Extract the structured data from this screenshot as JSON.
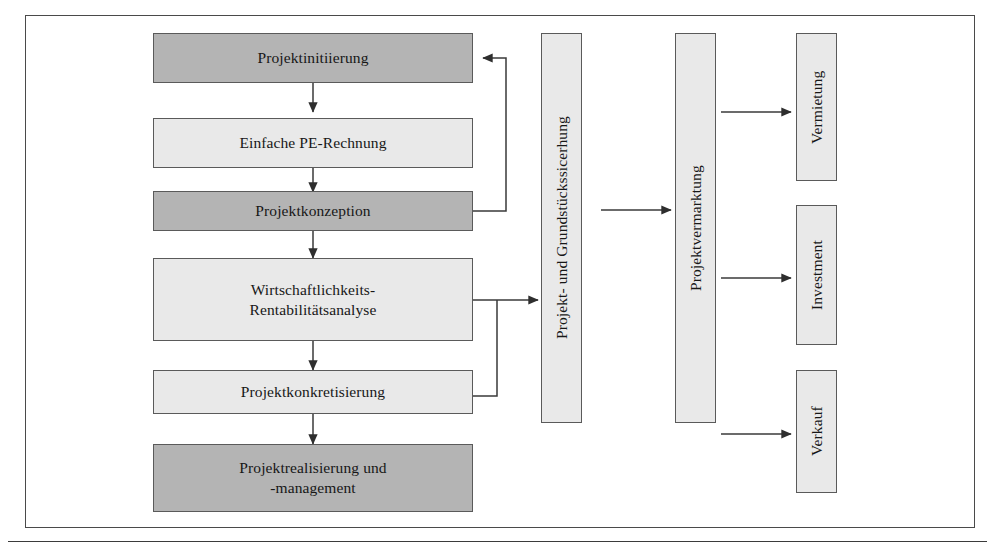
{
  "diagram": {
    "frame": {
      "visible": true,
      "border_color": "#4a4a4a"
    },
    "colors": {
      "dark_fill": "#b4b4b4",
      "light_fill": "#e9e9e9",
      "box_border": "#5a5a5a",
      "connector": "#3a3a3a",
      "background": "#ffffff"
    },
    "nodes": [
      {
        "id": "projektinitiierung",
        "label": "Projektinitiierung",
        "shade": "dark",
        "orientation": "horizontal"
      },
      {
        "id": "einfache-pe-rechnung",
        "label": "Einfache PE-Rechnung",
        "shade": "light",
        "orientation": "horizontal"
      },
      {
        "id": "projektkonzeption",
        "label": "Projektkonzeption",
        "shade": "dark",
        "orientation": "horizontal"
      },
      {
        "id": "wirtschaftlichkeit",
        "label": "Wirtschaftlichkeits-\nRentabilitätsanalyse",
        "shade": "light",
        "orientation": "horizontal"
      },
      {
        "id": "projektkonkretisierung",
        "label": "Projektkonkretisierung",
        "shade": "light",
        "orientation": "horizontal"
      },
      {
        "id": "projektrealisierung",
        "label": "Projektrealisierung und\n-management",
        "shade": "dark",
        "orientation": "horizontal"
      },
      {
        "id": "grundstueckssicherung",
        "label": "Projekt- und Grundstückssicerhung",
        "shade": "light",
        "orientation": "vertical"
      },
      {
        "id": "projektvermarktung",
        "label": "Projektvermarktung",
        "shade": "light",
        "orientation": "vertical"
      },
      {
        "id": "vermietung",
        "label": "Vermietung",
        "shade": "light",
        "orientation": "vertical"
      },
      {
        "id": "investment",
        "label": "Investment",
        "shade": "light",
        "orientation": "vertical"
      },
      {
        "id": "verkauf",
        "label": "Verkauf",
        "shade": "light",
        "orientation": "vertical"
      }
    ],
    "edges": [
      {
        "from": "projektinitiierung",
        "to": "einfache-pe-rechnung",
        "style": "arrow-down"
      },
      {
        "from": "einfache-pe-rechnung",
        "to": "projektkonzeption",
        "style": "arrow-down"
      },
      {
        "from": "projektkonzeption",
        "to": "wirtschaftlichkeit",
        "style": "arrow-down"
      },
      {
        "from": "wirtschaftlichkeit",
        "to": "projektkonkretisierung",
        "style": "arrow-down"
      },
      {
        "from": "projektkonkretisierung",
        "to": "projektrealisierung",
        "style": "arrow-down"
      },
      {
        "from": "projektkonzeption",
        "to": "projektinitiierung",
        "style": "feedback-loop-right"
      },
      {
        "from": "wirtschaftlichkeit",
        "to": "grundstueckssicherung",
        "style": "arrow-right"
      },
      {
        "from": "projektkonkretisierung",
        "to": "grundstueckssicherung",
        "style": "joins-right-bus"
      },
      {
        "from": "grundstueckssicherung",
        "to": "projektvermarktung",
        "style": "arrow-right"
      },
      {
        "from": "projektvermarktung",
        "to": "vermietung",
        "style": "arrow-right"
      },
      {
        "from": "projektvermarktung",
        "to": "investment",
        "style": "arrow-right"
      },
      {
        "from": "projektvermarktung",
        "to": "verkauf",
        "style": "arrow-right"
      }
    ],
    "caption": ""
  }
}
